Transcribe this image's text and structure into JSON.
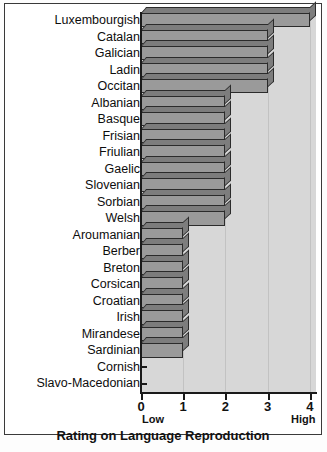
{
  "chart_data": {
    "type": "bar",
    "orientation": "horizontal",
    "title": "",
    "xlabel": "Rating on Language Reproduction",
    "ylabel": "",
    "xlim": [
      0,
      4
    ],
    "xticks": [
      0,
      1,
      2,
      3,
      4
    ],
    "xtick_labels": [
      "0",
      "1",
      "2",
      "3",
      "4"
    ],
    "axis_end_labels": {
      "low": "Low",
      "high": "High"
    },
    "grid": true,
    "legend": null,
    "categories": [
      "Luxembourgish",
      "Catalan",
      "Galician",
      "Ladin",
      "Occitan",
      "Albanian",
      "Basque",
      "Frisian",
      "Friulian",
      "Gaelic",
      "Slovenian",
      "Sorbian",
      "Welsh",
      "Aroumanian",
      "Berber",
      "Breton",
      "Corsican",
      "Croatian",
      "Irish",
      "Mirandese",
      "Sardinian",
      "Cornish",
      "Slavo-Macedonian"
    ],
    "values": [
      4,
      3,
      3,
      3,
      3,
      2,
      2,
      2,
      2,
      2,
      2,
      2,
      2,
      1,
      1,
      1,
      1,
      1,
      1,
      1,
      1,
      0,
      0
    ]
  },
  "colors": {
    "bar_face": "#9a9a9a",
    "bar_shade": "#7d7d7d",
    "bar_edge": "#2b2b2b",
    "plot_background": "#d7d7d7",
    "axis": "#1a1a1a",
    "page_background": "#ffffff"
  },
  "caption": ""
}
